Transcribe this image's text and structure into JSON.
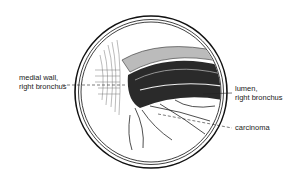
{
  "figure": {
    "type": "endoscopic view illustration",
    "labels": {
      "medial_wall": [
        "medial wall,",
        "right bronchus"
      ],
      "lumen": [
        "lumen,",
        "right bronchus"
      ],
      "carcinoma": "carcinoma"
    },
    "colors": {
      "ink": "#1a1a1a",
      "background": "#ffffff"
    }
  }
}
